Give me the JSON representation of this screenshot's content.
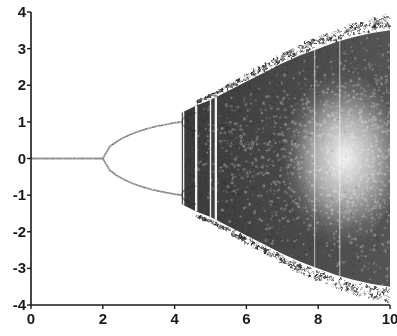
{
  "chart_data": {
    "type": "scatter",
    "title": "",
    "subtitle": "",
    "xlabel": "",
    "ylabel": "",
    "xlim": [
      0,
      10
    ],
    "ylim": [
      -4,
      4
    ],
    "grid": false,
    "legend": null,
    "x_ticks": [
      {
        "value": 0,
        "label": "0"
      },
      {
        "value": 2,
        "label": "2"
      },
      {
        "value": 4,
        "label": "4"
      },
      {
        "value": 6,
        "label": "6"
      },
      {
        "value": 8,
        "label": "8"
      },
      {
        "value": 10,
        "label": "10"
      }
    ],
    "y_ticks": [
      {
        "value": 4,
        "label": "4"
      },
      {
        "value": 3,
        "label": "3"
      },
      {
        "value": 2,
        "label": "2"
      },
      {
        "value": 1,
        "label": "1"
      },
      {
        "value": 0,
        "label": "0"
      },
      {
        "value": -1,
        "label": "-1"
      },
      {
        "value": -2,
        "label": "-2"
      },
      {
        "value": -3,
        "label": "-3"
      },
      {
        "value": -4,
        "label": "-4"
      }
    ],
    "ink_color": "#2b2b2b",
    "axis_color": "#1a1a1a",
    "background_color": "#ffffff",
    "features": {
      "fixed_point_branch": {
        "x_start": 0.0,
        "x_end": 2.0,
        "y": 0.0
      },
      "first_bifurcation_x": 2.0,
      "second_bifurcation_x": 4.2,
      "chaos_onset_x": 4.6,
      "periodic_windows_x": [
        4.25,
        4.6,
        5.0,
        5.15,
        7.9,
        8.6
      ],
      "envelope_at_x10": [
        -3.5,
        3.5
      ],
      "branch_upper_at_second_bifurcation": 1.0,
      "branch_lower_at_second_bifurcation": -1.0
    },
    "upper_branch": [
      {
        "x": 2.0,
        "y": 0.0
      },
      {
        "x": 2.2,
        "y": 0.33
      },
      {
        "x": 2.4,
        "y": 0.47
      },
      {
        "x": 2.6,
        "y": 0.58
      },
      {
        "x": 2.8,
        "y": 0.67
      },
      {
        "x": 3.0,
        "y": 0.74
      },
      {
        "x": 3.2,
        "y": 0.8
      },
      {
        "x": 3.4,
        "y": 0.86
      },
      {
        "x": 3.6,
        "y": 0.9
      },
      {
        "x": 3.8,
        "y": 0.94
      },
      {
        "x": 4.0,
        "y": 0.97
      },
      {
        "x": 4.2,
        "y": 1.0
      }
    ],
    "lower_branch": [
      {
        "x": 2.0,
        "y": 0.0
      },
      {
        "x": 2.2,
        "y": -0.33
      },
      {
        "x": 2.4,
        "y": -0.47
      },
      {
        "x": 2.6,
        "y": -0.58
      },
      {
        "x": 2.8,
        "y": -0.67
      },
      {
        "x": 3.0,
        "y": -0.74
      },
      {
        "x": 3.2,
        "y": -0.8
      },
      {
        "x": 3.4,
        "y": -0.86
      },
      {
        "x": 3.6,
        "y": -0.9
      },
      {
        "x": 3.8,
        "y": -0.94
      },
      {
        "x": 4.0,
        "y": -0.97
      },
      {
        "x": 4.2,
        "y": -1.0
      }
    ],
    "chaotic_envelope_upper": [
      {
        "x": 4.2,
        "y": 1.25
      },
      {
        "x": 4.6,
        "y": 1.45
      },
      {
        "x": 5.0,
        "y": 1.6
      },
      {
        "x": 5.5,
        "y": 1.85
      },
      {
        "x": 6.0,
        "y": 2.1
      },
      {
        "x": 6.5,
        "y": 2.35
      },
      {
        "x": 7.0,
        "y": 2.6
      },
      {
        "x": 7.5,
        "y": 2.82
      },
      {
        "x": 8.0,
        "y": 3.0
      },
      {
        "x": 8.5,
        "y": 3.18
      },
      {
        "x": 9.0,
        "y": 3.32
      },
      {
        "x": 9.5,
        "y": 3.43
      },
      {
        "x": 10.0,
        "y": 3.5
      }
    ],
    "chaotic_envelope_lower": [
      {
        "x": 4.2,
        "y": -1.25
      },
      {
        "x": 4.6,
        "y": -1.45
      },
      {
        "x": 5.0,
        "y": -1.6
      },
      {
        "x": 5.5,
        "y": -1.85
      },
      {
        "x": 6.0,
        "y": -2.1
      },
      {
        "x": 6.5,
        "y": -2.35
      },
      {
        "x": 7.0,
        "y": -2.6
      },
      {
        "x": 7.5,
        "y": -2.82
      },
      {
        "x": 8.0,
        "y": -3.0
      },
      {
        "x": 8.5,
        "y": -3.18
      },
      {
        "x": 9.0,
        "y": -3.32
      },
      {
        "x": 9.5,
        "y": -3.43
      },
      {
        "x": 10.0,
        "y": -3.5
      }
    ]
  },
  "background_bleed": {
    "note": "faint illegible show-through text from reverse of scanned page",
    "lines": [
      "quilting effects can be seen in",
      "explaining  Coriolis  with  a",
      "can be seen in the  region",
      "reported  a  similar  result"
    ]
  }
}
